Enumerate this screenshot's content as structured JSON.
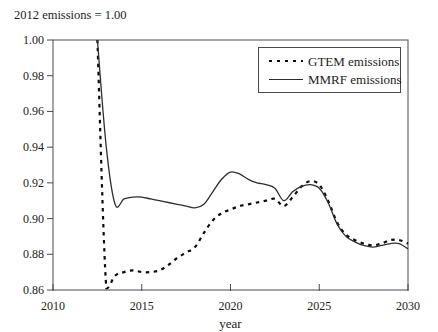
{
  "figure": {
    "subtitle": "2012 emissions = 1.00",
    "xlabel": "year"
  },
  "legend": {
    "position": "top-right",
    "entries": [
      {
        "label": "GTEM emissions",
        "style": "dashed"
      },
      {
        "label": "MMRF emissions",
        "style": "solid"
      }
    ]
  },
  "colors": {
    "background": "#ffffff",
    "axis": "#4a4a4a",
    "text": "#1c1c1c",
    "gtem_line": "#0d0d0d",
    "mmrf_line": "#2e2e2e"
  },
  "chart_data": {
    "type": "line",
    "title": "",
    "subtitle": "2012 emissions = 1.00",
    "xlabel": "year",
    "ylabel": "",
    "xlim": [
      2010,
      2030
    ],
    "ylim": [
      0.86,
      1.0
    ],
    "grid": false,
    "x_ticks": [
      2010,
      2015,
      2020,
      2025,
      2030
    ],
    "x_tick_labels": [
      "2010",
      "2015",
      "2020",
      "2025",
      "2030"
    ],
    "y_ticks": [
      0.86,
      0.88,
      0.9,
      0.92,
      0.94,
      0.96,
      0.98,
      1.0
    ],
    "y_tick_labels": [
      "0.86",
      "0.88",
      "0.90",
      "0.92",
      "0.94",
      "0.96",
      "0.98",
      "1.00"
    ],
    "x": [
      2012.5,
      2013,
      2013.5,
      2014,
      2014.5,
      2015,
      2015.5,
      2016,
      2016.5,
      2017,
      2017.5,
      2018,
      2018.5,
      2019,
      2019.5,
      2020,
      2020.5,
      2021,
      2021.5,
      2022,
      2022.5,
      2023,
      2023.5,
      2024,
      2024.5,
      2025,
      2025.5,
      2026,
      2026.5,
      2027,
      2027.5,
      2028,
      2028.5,
      2029,
      2029.5,
      2030
    ],
    "series": [
      {
        "name": "GTEM emissions",
        "line_style": "dashed",
        "values": [
          1.0,
          0.861,
          0.868,
          0.87,
          0.871,
          0.87,
          0.87,
          0.871,
          0.874,
          0.878,
          0.881,
          0.884,
          0.892,
          0.899,
          0.903,
          0.905,
          0.907,
          0.908,
          0.909,
          0.91,
          0.911,
          0.907,
          0.912,
          0.918,
          0.921,
          0.919,
          0.91,
          0.898,
          0.891,
          0.888,
          0.886,
          0.885,
          0.886,
          0.888,
          0.888,
          0.886
        ]
      },
      {
        "name": "MMRF emissions",
        "line_style": "solid",
        "values": [
          1.0,
          0.94,
          0.908,
          0.911,
          0.912,
          0.912,
          0.911,
          0.91,
          0.909,
          0.908,
          0.907,
          0.906,
          0.908,
          0.915,
          0.922,
          0.926,
          0.925,
          0.922,
          0.92,
          0.919,
          0.917,
          0.91,
          0.915,
          0.918,
          0.919,
          0.917,
          0.909,
          0.897,
          0.89,
          0.887,
          0.885,
          0.884,
          0.885,
          0.886,
          0.886,
          0.883
        ]
      }
    ]
  }
}
